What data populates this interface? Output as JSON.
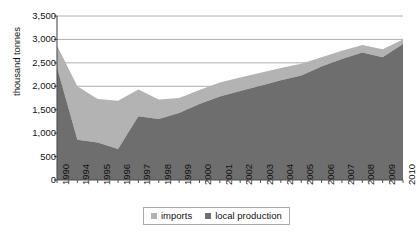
{
  "chart_data": {
    "type": "area",
    "stacked": true,
    "title": "",
    "xlabel": "",
    "ylabel": "thousand tonnes",
    "ylim": [
      0,
      3500
    ],
    "ytick_step": 500,
    "grid": true,
    "legend_position": "bottom",
    "ytick_labels": [
      "0",
      "500",
      "1,000",
      "1,500",
      "2,000",
      "2,500",
      "3,000",
      "3,500"
    ],
    "ytick_values": [
      0,
      500,
      1000,
      1500,
      2000,
      2500,
      3000,
      3500
    ],
    "categories": [
      "1990",
      "1994",
      "1995",
      "1996",
      "1997",
      "1998",
      "1999",
      "2000",
      "2001",
      "2002",
      "2003",
      "2004",
      "2005",
      "2006",
      "2007",
      "2008",
      "2009",
      "2010"
    ],
    "series": [
      {
        "name": "local production",
        "color": "#6e6e6e",
        "values": [
          2400,
          860,
          800,
          660,
          1360,
          1300,
          1430,
          1620,
          1780,
          1900,
          2010,
          2130,
          2230,
          2420,
          2580,
          2720,
          2620,
          2900
        ]
      },
      {
        "name": "imports",
        "color": "#b3b3b3",
        "values": [
          470,
          1140,
          930,
          1030,
          570,
          420,
          320,
          300,
          300,
          290,
          280,
          260,
          250,
          200,
          180,
          160,
          170,
          100
        ]
      }
    ],
    "totals": [
      2870,
      2000,
      1730,
      1690,
      1930,
      1720,
      1750,
      1920,
      2080,
      2190,
      2290,
      2390,
      2480,
      2620,
      2760,
      2880,
      2790,
      3000
    ]
  },
  "legend": {
    "items": [
      {
        "label": "imports",
        "color": "#b3b3b3"
      },
      {
        "label": "local production",
        "color": "#6e6e6e"
      }
    ]
  },
  "axis": {
    "y_title": "thousand tonnes"
  },
  "colors": {
    "imports": "#b3b3b3",
    "local_production": "#6e6e6e",
    "grid": "#999999",
    "axis": "#4d4d4d",
    "background": "#ffffff"
  }
}
